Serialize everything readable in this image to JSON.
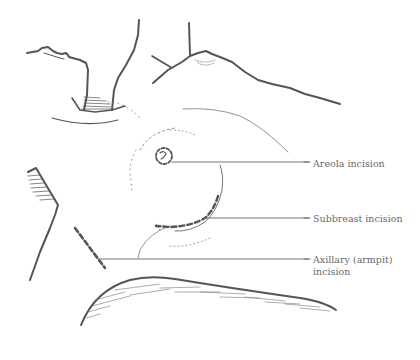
{
  "diagram": {
    "type": "medical-illustration",
    "labels": [
      {
        "id": "areola",
        "text": "Areola incision"
      },
      {
        "id": "subbreast",
        "text": "Subbreast incision"
      },
      {
        "id": "axillary",
        "text": "Axillary (armpit)",
        "text_line2": "incision"
      }
    ],
    "colors": {
      "ink": "#555555",
      "label_text": "#6a6a6a",
      "background": "#ffffff"
    }
  }
}
